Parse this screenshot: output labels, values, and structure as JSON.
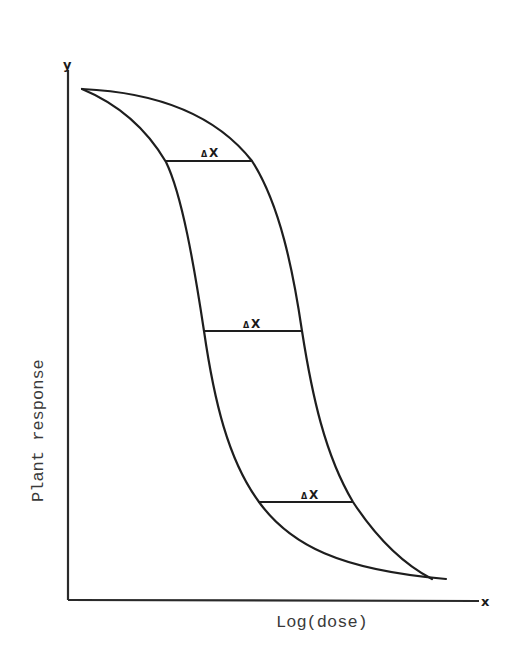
{
  "figure": {
    "x_axis_letter": "x",
    "y_axis_letter": "y",
    "x_axis_label": "Log(dose)",
    "y_axis_label": "Plant response",
    "interval_labels": [
      {
        "delta": "Δ",
        "var": "X"
      },
      {
        "delta": "Δ",
        "var": "X"
      },
      {
        "delta": "Δ",
        "var": "X"
      }
    ],
    "colors": {
      "ink": "#1e1e1e",
      "background": "#ffffff"
    }
  },
  "diagram": {
    "type": "dose-response-envelope",
    "curves": [
      {
        "name": "left-curve",
        "description": "steeper lower-bound sigmoid (log-dose vs response)"
      },
      {
        "name": "right-curve",
        "description": "upper-bound sigmoid (log-dose vs response)"
      }
    ],
    "horizontal_intervals": [
      "top",
      "middle",
      "bottom"
    ]
  }
}
